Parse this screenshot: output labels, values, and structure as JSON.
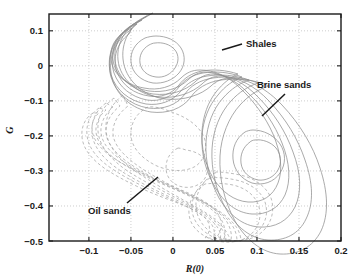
{
  "chart_data": {
    "type": "line",
    "title": "",
    "subtitle": "",
    "xlabel": "R(0)",
    "ylabel": "G",
    "xlim": [
      -0.1475,
      0.2
    ],
    "ylim": [
      -0.5,
      0.148
    ],
    "grid": true,
    "legend_position": "none",
    "xticks": [
      -0.1,
      -0.05,
      0,
      0.05,
      0.1,
      0.15,
      0.2
    ],
    "xticklabels": [
      "-0.1",
      "-0.05",
      "0",
      "0.05",
      "0.1",
      "0.15",
      "0.2"
    ],
    "yticks": [
      0.1,
      0,
      -0.1,
      -0.2,
      -0.3,
      -0.4,
      -0.5
    ],
    "yticklabels": [
      "0.1",
      "0",
      "-0.1",
      "-0.2",
      "-0.3",
      "-0.4",
      "-0.5"
    ],
    "series": [
      {
        "name": "Shales and brine sands density (solid contours)",
        "linestyle": "solid",
        "color": "#8e8e8e",
        "n_levels": 5,
        "modes": [
          {
            "label": "Shales",
            "center_x": -0.012,
            "center_y": 0.028
          },
          {
            "label": "Brine sands",
            "center_x": 0.1,
            "center_y": -0.215
          }
        ]
      },
      {
        "name": "Oil sands density (dashed contours)",
        "linestyle": "dashed",
        "color": "#a6a6a6",
        "n_levels": 5,
        "modes": [
          {
            "label": "Oil sands",
            "center_x": -0.035,
            "center_y": -0.135
          },
          {
            "label": "Oil sands secondary",
            "center_x": 0.088,
            "center_y": -0.365
          }
        ]
      }
    ],
    "annotations": [
      {
        "id": "shales",
        "text": "Shales",
        "label_x": 0.072,
        "label_y": 0.063,
        "leader_from_x": 0.034,
        "leader_from_y": 0.049,
        "leader_to_x": 0.062,
        "leader_to_y": 0.063
      },
      {
        "id": "brine-sands",
        "text": "Brine sands",
        "label_x": 0.118,
        "label_y": -0.055,
        "leader_from_x": 0.107,
        "leader_from_y": -0.125,
        "leader_to_x": 0.137,
        "leader_to_y": -0.073
      },
      {
        "id": "oil-sands",
        "text": "Oil sands",
        "label_x": -0.092,
        "label_y": -0.4,
        "leader_from_x": -0.052,
        "leader_from_y": -0.382,
        "leader_to_x": -0.012,
        "leader_to_y": -0.295
      }
    ]
  },
  "axes": {
    "x_title": "R(0)",
    "y_title": "G"
  }
}
